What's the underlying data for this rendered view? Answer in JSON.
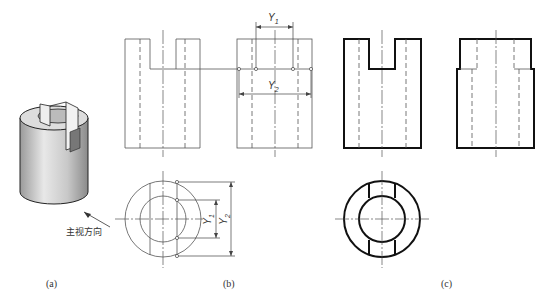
{
  "figure": {
    "panels": [
      {
        "id": "a",
        "caption": "(a)",
        "description": "isometric view of slotted hollow cylinder"
      },
      {
        "id": "b",
        "caption": "(b)",
        "description": "projection with dimension transfer Y1, Y2"
      },
      {
        "id": "c",
        "caption": "(c)",
        "description": "completed three views"
      }
    ],
    "view_direction_label": "主视方向",
    "dimensions": {
      "y1_label": "Y",
      "y1_sub": "1",
      "y2_label": "Y",
      "y2_sub": "2"
    }
  }
}
